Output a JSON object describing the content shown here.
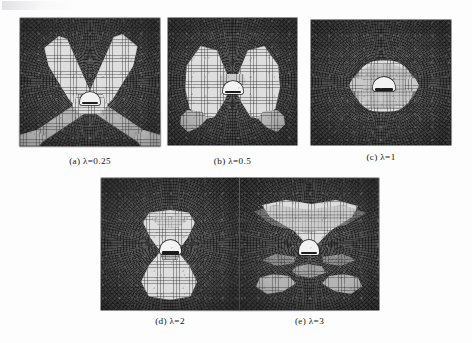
{
  "figure": {
    "background_color": "#fdfdfd",
    "mesh_dark_color": "#4d4d4d",
    "mesh_light_color": "#d4d4d4",
    "opening_color": "#f2f2f2",
    "caption_color": "#141414",
    "rows": [
      {
        "panel_ids": [
          "a",
          "b",
          "c"
        ]
      },
      {
        "panel_ids": [
          "d",
          "e"
        ]
      }
    ]
  },
  "panels": [
    {
      "id": "a",
      "label": "(a)",
      "symbol": "λ",
      "equals": "=",
      "value": "0.25",
      "caption": "(a)  λ=0.25",
      "description": "Finite element mesh with X-shaped light yielded zones extending diagonally from the tunnel opening to the model corners",
      "x": 20,
      "y": 18,
      "width": 140,
      "height": 128,
      "caption_x": 20,
      "caption_y": 156,
      "caption_width": 140
    },
    {
      "id": "b",
      "label": "(b)",
      "symbol": "λ",
      "equals": "=",
      "value": "0.5",
      "caption": "(b)  λ=0.5",
      "description": "Finite element mesh with two large butterfly-wing light zones on the left and right sides of the tunnel opening",
      "x": 168,
      "y": 18,
      "width": 129,
      "height": 127,
      "caption_x": 168,
      "caption_y": 156,
      "caption_width": 129
    },
    {
      "id": "c",
      "label": "(c)",
      "symbol": "λ",
      "equals": "=",
      "value": "1",
      "caption": "(c)  λ=1",
      "description": "Finite element mesh with a compact rounded light zone surrounding the tunnel opening",
      "x": 311,
      "y": 20,
      "width": 140,
      "height": 125,
      "caption_x": 311,
      "caption_y": 152,
      "caption_width": 140
    },
    {
      "id": "d",
      "label": "(d)",
      "symbol": "λ",
      "equals": "=",
      "value": "2",
      "caption": "(d)  λ=2",
      "description": "Finite element mesh with a vertical hourglass shaped light zone above and below the tunnel opening",
      "x": 101,
      "y": 178,
      "width": 138,
      "height": 132,
      "caption_x": 101,
      "caption_y": 316,
      "caption_width": 138
    },
    {
      "id": "e",
      "label": "(e)",
      "symbol": "λ",
      "equals": "=",
      "value": "3",
      "caption": "(e)  λ=3",
      "description": "Finite element mesh with a broad wing shaped light zone above the opening and scattered light patches below",
      "x": 240,
      "y": 178,
      "width": 139,
      "height": 132,
      "caption_x": 240,
      "caption_y": 316,
      "caption_width": 139
    }
  ]
}
